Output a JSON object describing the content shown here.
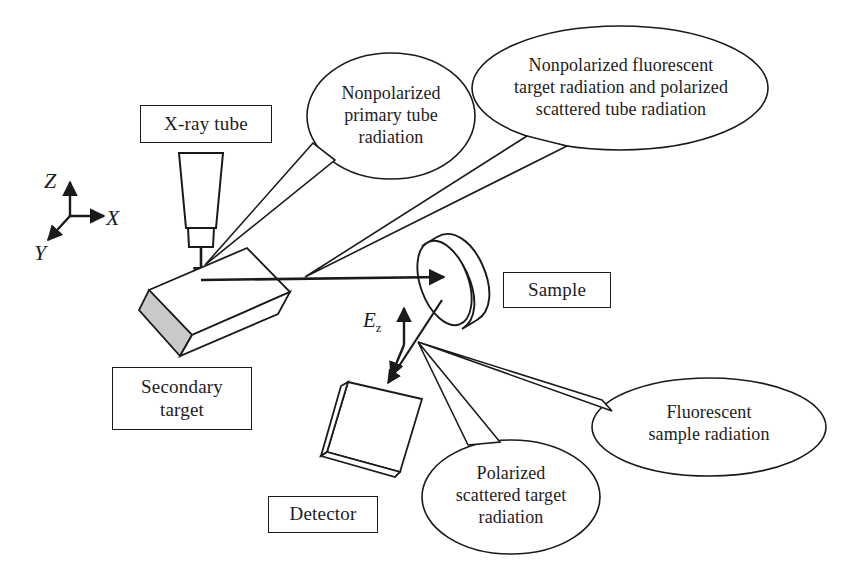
{
  "figure": {
    "background_color": "#ffffff",
    "line_color": "#1a1a1a",
    "shade_color": "#c8c8c8"
  },
  "axes": {
    "z_label": "Z",
    "x_label": "X",
    "y_label": "Y"
  },
  "vectors": {
    "ez_symbol": "E",
    "ez_subscript": "z"
  },
  "components": [
    {
      "id": "xray-tube",
      "label": "X-ray tube"
    },
    {
      "id": "sample",
      "label": "Sample"
    },
    {
      "id": "detector",
      "label": "Detector"
    },
    {
      "id": "secondary-target",
      "label_line1": "Secondary",
      "label_line2": "target"
    }
  ],
  "callouts": [
    {
      "id": "primary-tube-radiation",
      "line1": "Nonpolarized",
      "line2": "primary tube",
      "line3": "radiation"
    },
    {
      "id": "fluorescent-target-radiation",
      "line1": "Nonpolarized fluorescent",
      "line2": "target radiation and polarized",
      "line3": "scattered tube radiation"
    },
    {
      "id": "polarized-scattered-target-radiation",
      "line1": "Polarized",
      "line2": "scattered target",
      "line3": "radiation"
    },
    {
      "id": "fluorescent-sample-radiation",
      "line1": "Fluorescent",
      "line2": "sample radiation"
    }
  ]
}
